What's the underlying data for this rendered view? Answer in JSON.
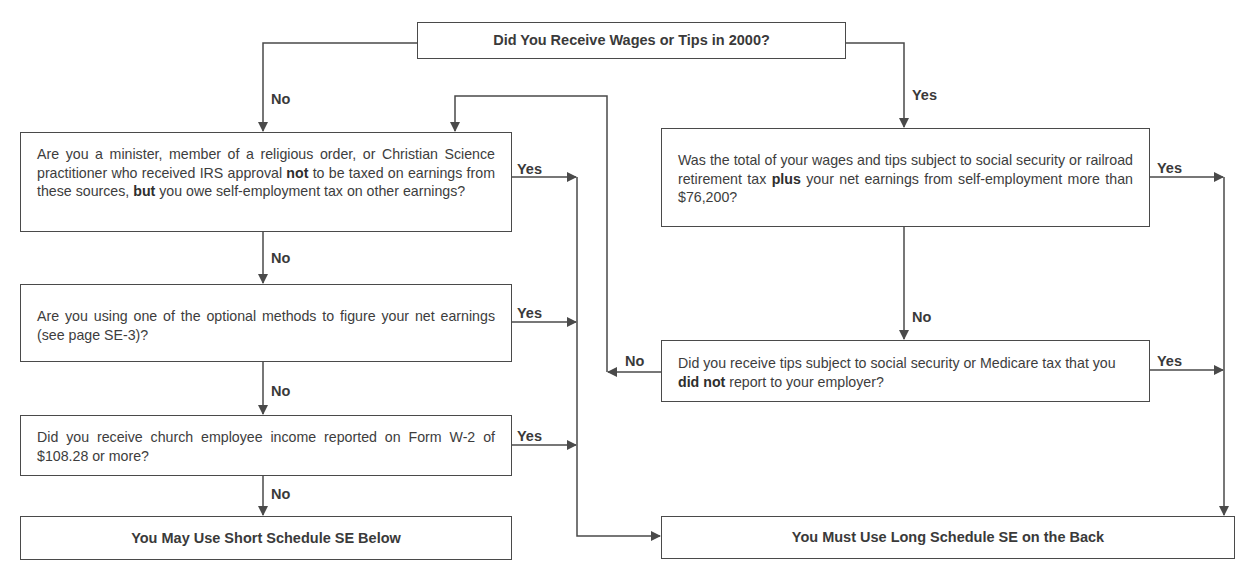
{
  "flowchart": {
    "start": {
      "text": "Did You Receive Wages or Tips in 2000?"
    },
    "left_questions": [
      {
        "pre": "Are you a minister, member of a religious order, or Christian Science practitioner who received IRS approval ",
        "bold": "not",
        "mid": " to be taxed on earnings from these sources, ",
        "bold2": "but",
        "post": " you owe self-employment tax on other earnings?"
      },
      {
        "text": "Are you using one of the optional methods to figure your net earnings (see page SE-3)?"
      },
      {
        "text": "Did you receive church employee income reported on Form W-2 of $108.28 or more?"
      }
    ],
    "right_questions": [
      {
        "pre": "Was the total of your wages and tips subject to social security or railroad retirement tax ",
        "bold": "plus",
        "post": " your net earnings from self-employment more than $76,200?"
      },
      {
        "pre": "Did you receive tips subject to social security or Medicare tax that you ",
        "bold": "did not",
        "post": " report to your employer?"
      }
    ],
    "outcomes": {
      "short": "You May Use Short Schedule SE Below",
      "long": "You Must Use Long Schedule SE on the Back"
    },
    "labels": {
      "yes": "Yes",
      "no": "No"
    },
    "colors": {
      "line": "#4a4a4a",
      "text": "#3d3d3d",
      "background": "#ffffff"
    }
  }
}
